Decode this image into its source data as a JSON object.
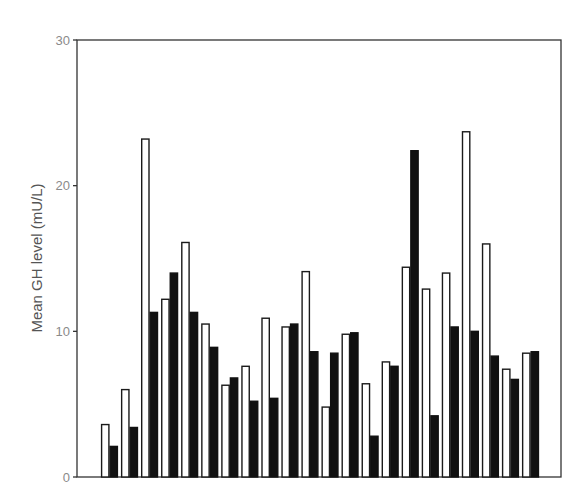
{
  "chart_data": {
    "type": "bar",
    "title": "",
    "xlabel": "",
    "ylabel": "Mean GH level (mU/L)",
    "ylim": [
      0,
      30
    ],
    "yticks": [
      0,
      10,
      20,
      30
    ],
    "grid": false,
    "legend": null,
    "categories": [
      "1",
      "2",
      "3",
      "4",
      "5",
      "6",
      "7",
      "8",
      "9",
      "10",
      "11",
      "12",
      "13",
      "14",
      "15",
      "16",
      "17",
      "18",
      "19",
      "20",
      "21",
      "22"
    ],
    "series": [
      {
        "name": "open bars",
        "fill": "#ffffff",
        "stroke": "#1a1a1a",
        "values": [
          3.6,
          6.0,
          23.2,
          12.2,
          16.1,
          10.5,
          6.3,
          7.6,
          10.9,
          10.3,
          14.1,
          4.8,
          9.8,
          6.4,
          7.9,
          14.4,
          12.9,
          14.0,
          23.7,
          16.0,
          7.4,
          8.5
        ]
      },
      {
        "name": "filled bars",
        "fill": "#111111",
        "stroke": "#111111",
        "values": [
          2.1,
          3.4,
          11.3,
          14.0,
          11.3,
          8.9,
          6.8,
          5.2,
          5.4,
          10.5,
          8.6,
          8.5,
          9.9,
          2.8,
          7.6,
          22.4,
          4.2,
          10.3,
          10.0,
          8.3,
          6.7,
          8.6
        ]
      }
    ]
  }
}
